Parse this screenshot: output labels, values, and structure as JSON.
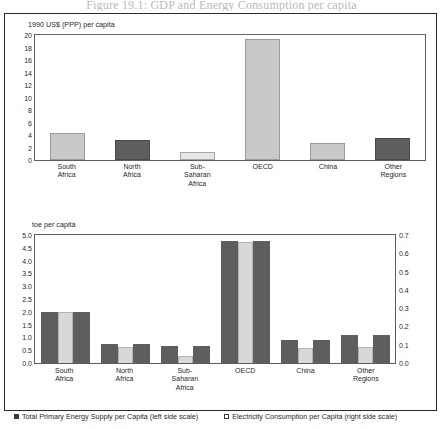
{
  "page_title": "Figure 19.1:  GDP and Energy Consumption per capita",
  "chart_data": [
    {
      "type": "bar",
      "title": "",
      "ylabel": "1990 US$ (PPP) per capita",
      "xlabel": "",
      "categories": [
        "South\nAfrica",
        "North\nAfrica",
        "Sub-\nSaharan\nAfrica",
        "OECD",
        "China",
        "Other\nRegions"
      ],
      "values": [
        4.3,
        3.2,
        1.3,
        19.3,
        2.8,
        3.5
      ],
      "ylim": [
        0,
        20
      ],
      "yticks": [
        "20",
        "18",
        "16",
        "14",
        "12",
        "10",
        "8",
        "6",
        "4",
        "2",
        "0"
      ],
      "grid": false,
      "legend_position": "none",
      "bar_styles": [
        "light",
        "dark",
        "pale",
        "light",
        "light",
        "dark"
      ]
    },
    {
      "type": "bar",
      "title": "",
      "ylabel": "toe per capita",
      "xlabel": "",
      "categories": [
        "South\nAfrica",
        "North\nAfrica",
        "Sub-\nSaharan\nAfrica",
        "OECD",
        "China",
        "Other\nRegions"
      ],
      "series": [
        {
          "name": "Total Primary Energy Supply per Capita (left side scale)",
          "axis": "left",
          "values": [
            2.0,
            0.75,
            0.65,
            4.75,
            0.9,
            1.1
          ]
        },
        {
          "name": "Electricity Consumption per Capita (right side scale)",
          "axis": "right",
          "values": [
            0.28,
            0.09,
            0.04,
            0.66,
            0.08,
            0.09
          ]
        }
      ],
      "ylim": [
        0,
        5.0
      ],
      "yticks": [
        "5.0",
        "4.5",
        "4.0",
        "3.5",
        "3.0",
        "2.5",
        "2.0",
        "1.5",
        "1.0",
        "0.5",
        "0.0"
      ],
      "ylim_right": [
        0,
        0.7
      ],
      "yticks_right": [
        "0.7",
        "0.6",
        "0.5",
        "0.4",
        "0.3",
        "0.2",
        "0.1",
        "0.0"
      ],
      "grid": false,
      "legend_position": "bottom"
    }
  ],
  "panel1": {
    "axis_caption": "1990 US$ (PPP) per capita",
    "yticks": [
      "20",
      "18",
      "16",
      "14",
      "12",
      "10",
      "8",
      "6",
      "4",
      "2",
      "0"
    ],
    "xlabels": [
      {
        "line1": "South",
        "line2": "Africa",
        "line3": ""
      },
      {
        "line1": "North",
        "line2": "Africa",
        "line3": ""
      },
      {
        "line1": "Sub-",
        "line2": "Saharan",
        "line3": "Africa"
      },
      {
        "line1": "OECD",
        "line2": "",
        "line3": ""
      },
      {
        "line1": "China",
        "line2": "",
        "line3": ""
      },
      {
        "line1": "Other",
        "line2": "Regions",
        "line3": ""
      }
    ]
  },
  "panel2": {
    "axis_caption": "toe per capita",
    "yticks_left": [
      "5.0",
      "4.5",
      "4.0",
      "3.5",
      "3.0",
      "2.5",
      "2.0",
      "1.5",
      "1.0",
      "0.5",
      "0.0"
    ],
    "yticks_right": [
      "0.7",
      "0.6",
      "0.5",
      "0.4",
      "0.3",
      "0.2",
      "0.1",
      "0.0"
    ],
    "xlabels": [
      {
        "line1": "South",
        "line2": "Africa",
        "line3": ""
      },
      {
        "line1": "North",
        "line2": "Africa",
        "line3": ""
      },
      {
        "line1": "Sub-",
        "line2": "Saharan",
        "line3": "Africa"
      },
      {
        "line1": "OECD",
        "line2": "",
        "line3": ""
      },
      {
        "line1": "China",
        "line2": "",
        "line3": ""
      },
      {
        "line1": "Other",
        "line2": "Regions",
        "line3": ""
      }
    ]
  },
  "legend": {
    "item1": "Total Primary Energy Supply per Capita (left side scale)",
    "item2": "Electricity Consumption per Capita (right side scale)"
  },
  "colors": {
    "bar_light": "#c9c9c9",
    "bar_dark": "#5e5e5e",
    "bar_pale": "#e6e6e6",
    "frame": "#2b2b2b",
    "text": "#1f1f1f"
  }
}
